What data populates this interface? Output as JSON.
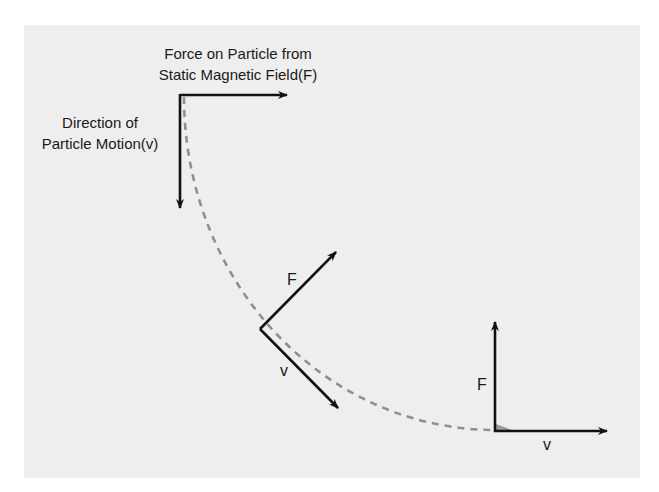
{
  "diagram": {
    "colors": {
      "background": "#ffffff",
      "panel": "#eeeeee",
      "arrow": "#111111",
      "trajectory": "#8f8f8f",
      "text": "#1a1a1a"
    },
    "labels": {
      "force_line1": "Force on Particle from",
      "force_line2": "Static Magnetic Field(F)",
      "motion_line1": "Direction of",
      "motion_line2": "Particle Motion(v)"
    },
    "vectors": [
      {
        "position": "start",
        "force_label": "",
        "velocity_label": "",
        "force_direction": "right",
        "velocity_direction": "down"
      },
      {
        "position": "middle",
        "force_label": "F",
        "velocity_label": "v",
        "force_direction": "up-right",
        "velocity_direction": "down-right"
      },
      {
        "position": "end",
        "force_label": "F",
        "velocity_label": "v",
        "force_direction": "up",
        "velocity_direction": "right"
      }
    ],
    "trajectory": {
      "style": "dashed",
      "shape": "quarter-circle arc"
    }
  }
}
